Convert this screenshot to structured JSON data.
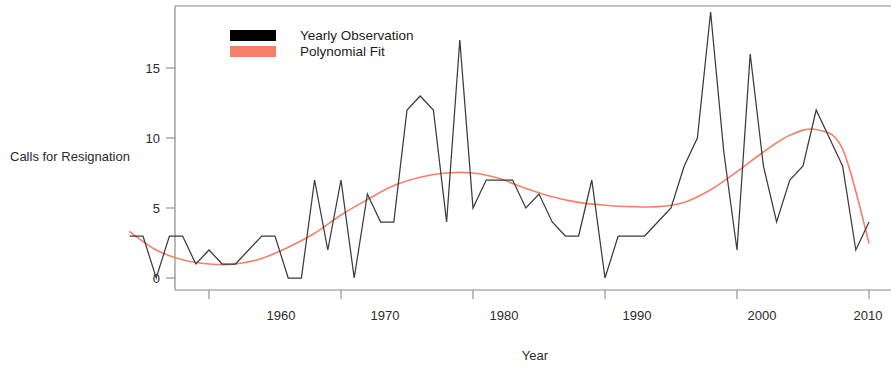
{
  "chart_data": {
    "type": "line",
    "title": "",
    "xlabel": "Year",
    "ylabel": "Calls for Resignation",
    "xlim": [
      1954,
      2010
    ],
    "ylim": [
      -0.6,
      19.6
    ],
    "xticks": [
      1960,
      1970,
      1980,
      1990,
      2000,
      2010
    ],
    "xtick_labels": [
      "1960",
      "1970",
      "1980",
      "1990",
      "2000",
      "2010"
    ],
    "yticks": [
      0,
      5,
      10,
      15
    ],
    "ytick_labels": [
      "0",
      "5",
      "10",
      "15"
    ],
    "grid": false,
    "legend_position": "top-left",
    "series": [
      {
        "name": "Yearly Observation",
        "color": "#3b3b3b",
        "style": "step-line",
        "x": [
          1954,
          1955,
          1956,
          1957,
          1958,
          1959,
          1960,
          1961,
          1962,
          1963,
          1964,
          1965,
          1966,
          1967,
          1968,
          1969,
          1970,
          1971,
          1972,
          1973,
          1974,
          1975,
          1976,
          1977,
          1978,
          1979,
          1980,
          1981,
          1982,
          1983,
          1984,
          1985,
          1986,
          1987,
          1988,
          1989,
          1990,
          1991,
          1992,
          1993,
          1994,
          1995,
          1996,
          1997,
          1998,
          1999,
          2000,
          2001,
          2002,
          2003,
          2004,
          2005,
          2006,
          2007,
          2008,
          2009,
          2010
        ],
        "values": [
          3,
          3,
          0,
          3,
          3,
          1,
          2,
          1,
          1,
          2,
          3,
          3,
          0,
          0,
          7,
          2,
          7,
          0,
          6,
          4,
          4,
          12,
          13,
          12,
          4,
          17,
          5,
          7,
          7,
          7,
          5,
          6,
          4,
          3,
          3,
          7,
          0,
          3,
          3,
          3,
          4,
          5,
          8,
          10,
          19,
          9,
          2,
          16,
          8,
          4,
          7,
          8,
          12,
          10,
          8,
          2,
          4
        ]
      },
      {
        "name": "Polynomial Fit",
        "color": "#f4806a",
        "style": "smooth-curve",
        "x": [
          1954,
          1956,
          1958,
          1960,
          1962,
          1964,
          1966,
          1968,
          1970,
          1972,
          1974,
          1976,
          1978,
          1980,
          1982,
          1984,
          1986,
          1988,
          1990,
          1992,
          1994,
          1996,
          1998,
          2000,
          2002,
          2004,
          2006,
          2008,
          2010
        ],
        "values": [
          3.3,
          2.0,
          1.3,
          1.0,
          1.0,
          1.4,
          2.2,
          3.2,
          4.5,
          5.6,
          6.6,
          7.2,
          7.5,
          7.5,
          7.1,
          6.4,
          5.8,
          5.4,
          5.2,
          5.1,
          5.1,
          5.4,
          6.3,
          7.6,
          9.0,
          10.2,
          10.6,
          9.2,
          2.5
        ]
      }
    ],
    "legend": [
      {
        "label": "Yearly Observation",
        "color": "#000000",
        "swatch": "filled-rect"
      },
      {
        "label": "Polynomial Fit",
        "color": "#f4806a",
        "swatch": "filled-rect"
      }
    ]
  },
  "axes": {
    "y_axis_title": "Calls for Resignation",
    "x_axis_title": "Year"
  },
  "colors": {
    "observation": "#3b3b3b",
    "fit": "#f4806a",
    "frame": "#8a8a8a",
    "text": "#2b2b2b",
    "background": "#ffffff"
  }
}
